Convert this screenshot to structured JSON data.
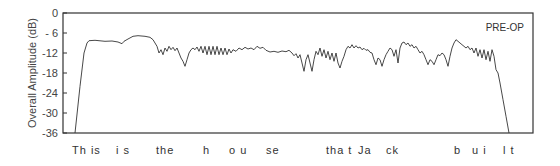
{
  "chart_data": {
    "type": "line",
    "title": "",
    "annotation": "PRE-OP",
    "xlabel": "This is the house that Jack built",
    "ylabel": "Overall Amplitude (dB)",
    "ylim": [
      -36,
      0
    ],
    "yticks": [
      0,
      -6,
      -12,
      -18,
      -24,
      -30,
      -36
    ],
    "ytick_labels": [
      "0",
      "- 6",
      "-12",
      "-18",
      "-24",
      "-30",
      "-36"
    ],
    "grid": false,
    "x_word_labels": [
      {
        "text": "Th is",
        "x": 72
      },
      {
        "text": "i s",
        "x": 116
      },
      {
        "text": "the",
        "x": 156
      },
      {
        "text": "h",
        "x": 203
      },
      {
        "text": "o u",
        "x": 229
      },
      {
        "text": "se",
        "x": 266
      },
      {
        "text": "tha t",
        "x": 326
      },
      {
        "text": "Ja",
        "x": 358
      },
      {
        "text": "ck",
        "x": 386
      },
      {
        "text": "b",
        "x": 454
      },
      {
        "text": "u i",
        "x": 472
      },
      {
        "text": "l t",
        "x": 503
      }
    ],
    "series": [
      {
        "name": "PRE-OP",
        "points": [
          [
            75,
            -36
          ],
          [
            80,
            -22
          ],
          [
            84,
            -12
          ],
          [
            87,
            -9
          ],
          [
            89,
            -8.3
          ],
          [
            95,
            -8.2
          ],
          [
            105,
            -8.5
          ],
          [
            112,
            -8.4
          ],
          [
            118,
            -8.7
          ],
          [
            122,
            -9.2
          ],
          [
            124,
            -8.5
          ],
          [
            128,
            -7.8
          ],
          [
            133,
            -7
          ],
          [
            138,
            -6.8
          ],
          [
            145,
            -7
          ],
          [
            150,
            -7.3
          ],
          [
            153,
            -8
          ],
          [
            155,
            -9
          ],
          [
            157,
            -10
          ],
          [
            159,
            -12
          ],
          [
            161,
            -11
          ],
          [
            163,
            -12.5
          ],
          [
            165,
            -10.5
          ],
          [
            167,
            -11.5
          ],
          [
            169,
            -10
          ],
          [
            171,
            -11
          ],
          [
            173,
            -10.3
          ],
          [
            175,
            -11.3
          ],
          [
            177,
            -10.5
          ],
          [
            179,
            -12
          ],
          [
            181,
            -13.5
          ],
          [
            183,
            -14.5
          ],
          [
            185,
            -16
          ],
          [
            187,
            -14
          ],
          [
            189,
            -12
          ],
          [
            191,
            -11
          ],
          [
            193,
            -10.5
          ],
          [
            195,
            -11
          ],
          [
            197,
            -10.2
          ],
          [
            199,
            -11.5
          ],
          [
            201,
            -10
          ],
          [
            203,
            -12
          ],
          [
            205,
            -10
          ],
          [
            207,
            -12.5
          ],
          [
            209,
            -10
          ],
          [
            211,
            -12.5
          ],
          [
            213,
            -10
          ],
          [
            215,
            -12.5
          ],
          [
            217,
            -10
          ],
          [
            219,
            -12.5
          ],
          [
            221,
            -10.5
          ],
          [
            223,
            -12.5
          ],
          [
            225,
            -10.5
          ],
          [
            227,
            -12.5
          ],
          [
            229,
            -10.8
          ],
          [
            231,
            -12
          ],
          [
            233,
            -11
          ],
          [
            236,
            -11.5
          ],
          [
            239,
            -10.5
          ],
          [
            242,
            -11
          ],
          [
            245,
            -10.3
          ],
          [
            248,
            -10.8
          ],
          [
            251,
            -10.5
          ],
          [
            254,
            -11
          ],
          [
            257,
            -10
          ],
          [
            260,
            -10.6
          ],
          [
            263,
            -10.3
          ],
          [
            266,
            -11.2
          ],
          [
            270,
            -11.7
          ],
          [
            274,
            -11.5
          ],
          [
            278,
            -11.8
          ],
          [
            282,
            -11.4
          ],
          [
            286,
            -11.6
          ],
          [
            289,
            -11.2
          ],
          [
            292,
            -12
          ],
          [
            294,
            -12.8
          ],
          [
            296,
            -12.2
          ],
          [
            298,
            -13.5
          ],
          [
            300,
            -12.5
          ],
          [
            302,
            -15
          ],
          [
            304,
            -17.5
          ],
          [
            306,
            -14
          ],
          [
            308,
            -12.5
          ],
          [
            310,
            -15
          ],
          [
            312,
            -17.5
          ],
          [
            314,
            -14
          ],
          [
            316,
            -11.5
          ],
          [
            318,
            -12.5
          ],
          [
            320,
            -10.5
          ],
          [
            322,
            -13
          ],
          [
            324,
            -11
          ],
          [
            326,
            -13.5
          ],
          [
            328,
            -11.5
          ],
          [
            330,
            -14
          ],
          [
            332,
            -12
          ],
          [
            334,
            -14.5
          ],
          [
            336,
            -12
          ],
          [
            338,
            -15
          ],
          [
            340,
            -16.5
          ],
          [
            342,
            -14.5
          ],
          [
            344,
            -13
          ],
          [
            346,
            -11
          ],
          [
            348,
            -10
          ],
          [
            350,
            -10.5
          ],
          [
            352,
            -9.5
          ],
          [
            354,
            -10.5
          ],
          [
            356,
            -9.8
          ],
          [
            358,
            -10.5
          ],
          [
            360,
            -10.2
          ],
          [
            362,
            -11
          ],
          [
            364,
            -10.6
          ],
          [
            366,
            -11.2
          ],
          [
            368,
            -11
          ],
          [
            370,
            -11.8
          ],
          [
            372,
            -12
          ],
          [
            374,
            -14
          ],
          [
            376,
            -15.5
          ],
          [
            378,
            -13.5
          ],
          [
            380,
            -14
          ],
          [
            382,
            -16
          ],
          [
            384,
            -14
          ],
          [
            386,
            -12.5
          ],
          [
            388,
            -11.5
          ],
          [
            390,
            -10.5
          ],
          [
            392,
            -11
          ],
          [
            394,
            -13
          ],
          [
            396,
            -11
          ],
          [
            398,
            -15
          ],
          [
            400,
            -10.5
          ],
          [
            402,
            -9
          ],
          [
            404,
            -8.7
          ],
          [
            406,
            -9.5
          ],
          [
            408,
            -9
          ],
          [
            410,
            -10
          ],
          [
            412,
            -9.5
          ],
          [
            414,
            -10.5
          ],
          [
            416,
            -10
          ],
          [
            418,
            -11
          ],
          [
            420,
            -12
          ],
          [
            422,
            -11.5
          ],
          [
            424,
            -12.5
          ],
          [
            426,
            -14
          ],
          [
            428,
            -15.5
          ],
          [
            430,
            -14
          ],
          [
            432,
            -14.5
          ],
          [
            434,
            -15.5
          ],
          [
            436,
            -14
          ],
          [
            438,
            -12.5
          ],
          [
            440,
            -12.8
          ],
          [
            442,
            -12
          ],
          [
            444,
            -12.5
          ],
          [
            446,
            -14
          ],
          [
            448,
            -16
          ],
          [
            450,
            -13
          ],
          [
            452,
            -10.5
          ],
          [
            454,
            -9
          ],
          [
            456,
            -8
          ],
          [
            458,
            -8.5
          ],
          [
            460,
            -9
          ],
          [
            462,
            -9.5
          ],
          [
            464,
            -10
          ],
          [
            466,
            -10.5
          ],
          [
            468,
            -10
          ],
          [
            470,
            -11
          ],
          [
            472,
            -10.5
          ],
          [
            474,
            -12
          ],
          [
            476,
            -10.5
          ],
          [
            478,
            -13
          ],
          [
            480,
            -11
          ],
          [
            482,
            -13.5
          ],
          [
            484,
            -11
          ],
          [
            486,
            -14
          ],
          [
            488,
            -11.5
          ],
          [
            490,
            -14.5
          ],
          [
            492,
            -11
          ],
          [
            494,
            -13
          ],
          [
            496,
            -17
          ],
          [
            498,
            -18
          ],
          [
            500,
            -21
          ],
          [
            503,
            -26
          ],
          [
            506,
            -31
          ],
          [
            509,
            -36
          ]
        ]
      }
    ]
  },
  "axes": {
    "ylabel": "Overall Amplitude (dB)",
    "annotation": "PRE-OP"
  }
}
